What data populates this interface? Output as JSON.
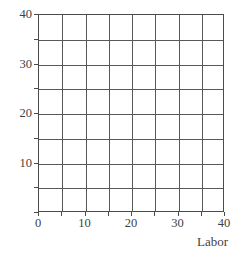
{
  "chart_data": {
    "type": "scatter",
    "title": "",
    "subtitle": "",
    "xlabel": "Labor",
    "ylabel": "",
    "xlim": [
      0,
      40
    ],
    "ylim": [
      0,
      40
    ],
    "grid": true,
    "grid_step": 5,
    "legend": null,
    "annotations": [],
    "series": [],
    "x_ticks": [
      {
        "value": 0,
        "label": "0"
      },
      {
        "value": 5,
        "label": ""
      },
      {
        "value": 10,
        "label": "10"
      },
      {
        "value": 15,
        "label": ""
      },
      {
        "value": 20,
        "label": "20"
      },
      {
        "value": 25,
        "label": ""
      },
      {
        "value": 30,
        "label": "30"
      },
      {
        "value": 35,
        "label": ""
      },
      {
        "value": 40,
        "label": "40"
      }
    ],
    "y_ticks": [
      {
        "value": 0,
        "label": ""
      },
      {
        "value": 5,
        "label": ""
      },
      {
        "value": 10,
        "label": "10"
      },
      {
        "value": 15,
        "label": ""
      },
      {
        "value": 20,
        "label": "20"
      },
      {
        "value": 25,
        "label": ""
      },
      {
        "value": 30,
        "label": "30"
      },
      {
        "value": 35,
        "label": ""
      },
      {
        "value": 40,
        "label": "40"
      }
    ],
    "gridlines_x": [
      0,
      5,
      10,
      15,
      20,
      25,
      30,
      35,
      40
    ],
    "gridlines_y": [
      0,
      5,
      10,
      15,
      20,
      25,
      30,
      35,
      40
    ]
  },
  "colors": {
    "background": "#ffffff",
    "axis": "#4c4c4c",
    "grid": "#595959",
    "text": "#3f3f3f"
  }
}
